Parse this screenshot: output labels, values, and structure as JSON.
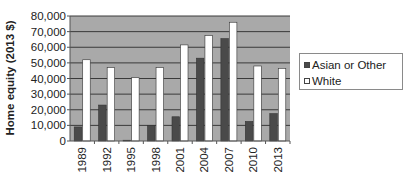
{
  "chart_data": {
    "type": "bar",
    "title": "",
    "xlabel": "",
    "ylabel": "Home equity (2013 $)",
    "ylim": [
      0,
      80000
    ],
    "yticks": [
      "0",
      "10,000",
      "20,000",
      "30,000",
      "40,000",
      "50,000",
      "60,000",
      "70,000",
      "80,000"
    ],
    "categories": [
      "1989",
      "1992",
      "1995",
      "1998",
      "2001",
      "2004",
      "2007",
      "2010",
      "2013"
    ],
    "series": [
      {
        "name": "Asian or Other",
        "color": "#4a4a4a",
        "values": [
          9000,
          23000,
          500,
          10000,
          15500,
          53000,
          65500,
          12500,
          17500
        ]
      },
      {
        "name": "White",
        "color": "#ffffff",
        "values": [
          52000,
          47000,
          40500,
          47000,
          61500,
          67500,
          76000,
          48000,
          46500
        ]
      }
    ],
    "grid": true,
    "plot_background": "#a9a9a9",
    "legend_position": "right"
  },
  "legend": {
    "items": [
      {
        "label": "Asian or Other",
        "color": "#4a4a4a"
      },
      {
        "label": "White",
        "color": "#ffffff"
      }
    ]
  }
}
